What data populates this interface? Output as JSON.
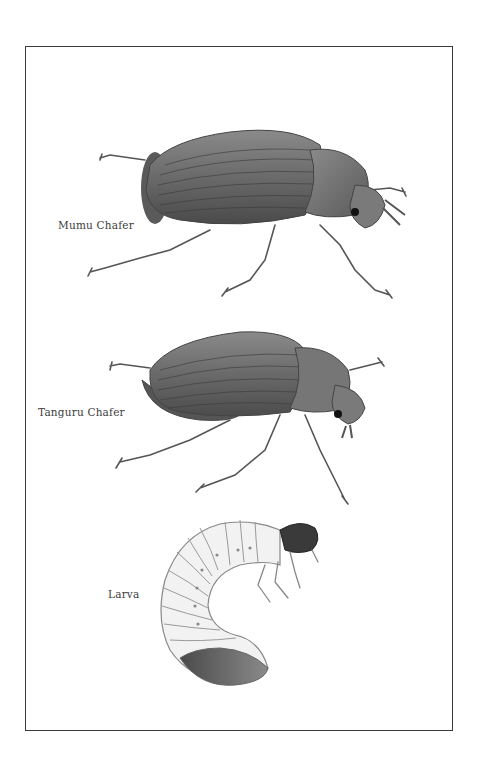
{
  "plate": {
    "border_color": "#3a3a3a",
    "background": "#ffffff",
    "figures": [
      {
        "id": "mumu-chafer",
        "label": "Mumu Chafer",
        "type": "adult beetle"
      },
      {
        "id": "tanguru-chafer",
        "label": "Tanguru Chafer",
        "type": "adult beetle"
      },
      {
        "id": "larva",
        "label": "Larva",
        "type": "grub"
      }
    ]
  }
}
